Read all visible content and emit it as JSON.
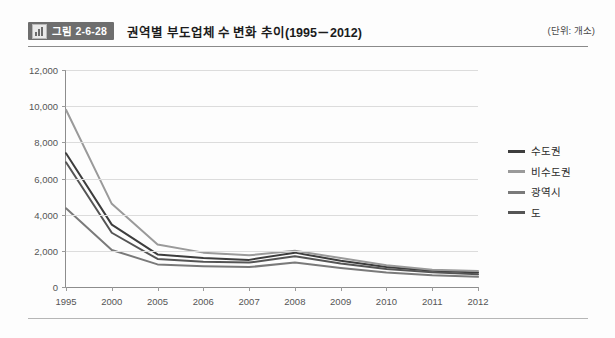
{
  "header": {
    "badge_icon": "bar-chart-icon",
    "badge_label": "그림 2-6-28",
    "title": "권역별 부도업체 수 변화 추이(1995－2012)",
    "unit": "(단위: 개소)"
  },
  "colors": {
    "sudogwon": "#3d3d3d",
    "bisudogwon": "#9a9a9a",
    "gwangyeoksi": "#7a7a7a",
    "do": "#555555",
    "grid": "#dcdcdc",
    "axis": "#8d8d8d",
    "badge_bg": "#6e6e6e"
  },
  "chart_data": {
    "type": "line",
    "title": "권역별 부도업체 수 변화 추이(1995－2012)",
    "xlabel": "",
    "ylabel": "",
    "unit": "개소",
    "categories": [
      "1995",
      "2000",
      "2005",
      "2006",
      "2007",
      "2008",
      "2009",
      "2010",
      "2011",
      "2012"
    ],
    "ylim": [
      0,
      12000
    ],
    "yticks": [
      "0",
      "2,000",
      "4,000",
      "6,000",
      "8,000",
      "10,000",
      "12,000"
    ],
    "ytick_values": [
      0,
      2000,
      4000,
      6000,
      8000,
      10000,
      12000
    ],
    "grid": true,
    "legend_position": "right",
    "series": [
      {
        "name": "수도권",
        "color": "#3d3d3d",
        "values": [
          7400,
          3450,
          1800,
          1600,
          1500,
          1900,
          1450,
          1100,
          900,
          800
        ]
      },
      {
        "name": "비수도권",
        "color": "#9a9a9a",
        "values": [
          9800,
          4600,
          2350,
          1900,
          1750,
          2000,
          1600,
          1200,
          950,
          880
        ]
      },
      {
        "name": "광역시",
        "color": "#7a7a7a",
        "values": [
          4350,
          2050,
          1250,
          1150,
          1100,
          1350,
          1050,
          800,
          650,
          560
        ]
      },
      {
        "name": "도",
        "color": "#555555",
        "values": [
          6900,
          3000,
          1550,
          1400,
          1350,
          1700,
          1300,
          1000,
          820,
          700
        ]
      }
    ]
  },
  "legend": {
    "items": [
      {
        "label": "수도권"
      },
      {
        "label": "비수도권"
      },
      {
        "label": "광역시"
      },
      {
        "label": "도"
      }
    ]
  }
}
